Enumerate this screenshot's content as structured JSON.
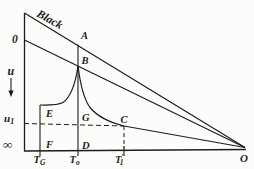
{
  "figure": {
    "title_line_label": "Black",
    "colors": {
      "ink": "#1c1c1c",
      "background": "#fcfcfa"
    },
    "labels": {
      "zero": "0",
      "u_axis": "u",
      "u1": {
        "main": "u",
        "sub": "1"
      },
      "infinity": "∞",
      "A": "A",
      "B": "B",
      "C": "C",
      "D": "D",
      "E": "E",
      "F": "F",
      "G": "G",
      "O": "O",
      "T_G": {
        "main": "T",
        "sub": "G"
      },
      "T_O": {
        "main": "T",
        "sub": "o"
      },
      "T_1": {
        "main": "T",
        "prime": "′",
        "sub": "1"
      }
    }
  }
}
